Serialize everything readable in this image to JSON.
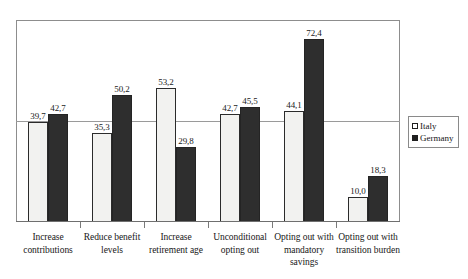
{
  "chart_data": {
    "type": "bar",
    "title": "",
    "subtitle": "",
    "xlabel": "",
    "ylabel": "",
    "ylim": [
      0,
      80
    ],
    "grid": "single horizontal reference line at 50",
    "legend_position": "right",
    "value_decimal_separator": ",",
    "categories": [
      "Increase contributions",
      "Reduce benefit levels",
      "Increase retirement age",
      "Unconditional opting out",
      "Opting out with mandatory savings",
      "Opting out with transition burden"
    ],
    "category_lines": [
      [
        "Increase",
        "contributions"
      ],
      [
        "Reduce benefit",
        "levels"
      ],
      [
        "Increase",
        "retirement age"
      ],
      [
        "Unconditional",
        "opting out"
      ],
      [
        "Opting out with",
        "mandatory",
        "savings"
      ],
      [
        "Opting out with",
        "transition burden"
      ]
    ],
    "series": [
      {
        "name": "Italy",
        "color": "#f2f2f0",
        "values": [
          39.7,
          35.3,
          53.2,
          42.7,
          44.1,
          10.0
        ],
        "labels": [
          "39,7",
          "35,3",
          "53,2",
          "42,7",
          "44,1",
          "10,0"
        ]
      },
      {
        "name": "Germany",
        "color": "#2e2e2e",
        "values": [
          42.7,
          50.2,
          29.8,
          45.5,
          72.4,
          18.3
        ],
        "labels": [
          "42,7",
          "50,2",
          "29,8",
          "45,5",
          "72,4",
          "18,3"
        ]
      }
    ]
  },
  "legend": {
    "items": [
      {
        "label": "Italy",
        "swatch": "open-square-swatch"
      },
      {
        "label": "Germany",
        "swatch": "filled-square-swatch"
      }
    ]
  }
}
